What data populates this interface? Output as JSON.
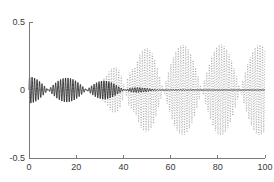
{
  "chart_data": {
    "type": "line",
    "title": "",
    "subtitle": "",
    "xlabel": "",
    "ylabel": "",
    "xlim": [
      0,
      100
    ],
    "ylim": [
      -0.5,
      0.5
    ],
    "grid": false,
    "legend": null,
    "background": "#ffffff",
    "axis_color": "#7a7a7a",
    "x_ticks": [
      0,
      20,
      40,
      60,
      80,
      100
    ],
    "x_tick_labels": [
      "0",
      "20",
      "40",
      "60",
      "80",
      "100"
    ],
    "y_ticks": [
      -0.5,
      0,
      0.5
    ],
    "y_tick_labels": [
      "-0.5",
      "0",
      "0.5"
    ],
    "series": [
      {
        "name": "decaying-oscillation",
        "style": "solid",
        "color": "#000000",
        "description": "High frequency oscillation with amplitude decaying from about 0.10 near x=0 to nearly 0 by x=55, remaining flat at 0 thereafter",
        "carrier_period": 1.05,
        "envelope": {
          "x": [
            0,
            5,
            10,
            15,
            20,
            25,
            30,
            33,
            36,
            39,
            42,
            45,
            48,
            52,
            56,
            60,
            70,
            80,
            90,
            100
          ],
          "amplitude": [
            0.098,
            0.097,
            0.094,
            0.09,
            0.086,
            0.081,
            0.072,
            0.066,
            0.058,
            0.046,
            0.034,
            0.024,
            0.016,
            0.009,
            0.005,
            0.003,
            0.002,
            0.001,
            0.001,
            0.001
          ]
        }
      },
      {
        "name": "growing-oscillation",
        "style": "dotted",
        "color": "#4d4d4d",
        "description": "High frequency oscillation emerging near x=28, spiking to about 0.44 near x=41, then settling to a steady amplitude near 0.33",
        "carrier_period": 1.05,
        "envelope": {
          "x": [
            0,
            20,
            26,
            30,
            33,
            36,
            38,
            40,
            41,
            42,
            43,
            45,
            47,
            50,
            53,
            56,
            60,
            65,
            70,
            75,
            80,
            85,
            90,
            95,
            100
          ],
          "amplitude": [
            0.0,
            0.004,
            0.02,
            0.055,
            0.11,
            0.21,
            0.3,
            0.39,
            0.44,
            0.41,
            0.3,
            0.225,
            0.28,
            0.315,
            0.345,
            0.32,
            0.335,
            0.33,
            0.338,
            0.33,
            0.336,
            0.33,
            0.334,
            0.33,
            0.334
          ]
        }
      }
    ]
  },
  "figure": {
    "plot_left": 29,
    "plot_right": 265,
    "plot_top": 22,
    "plot_bottom": 158
  }
}
